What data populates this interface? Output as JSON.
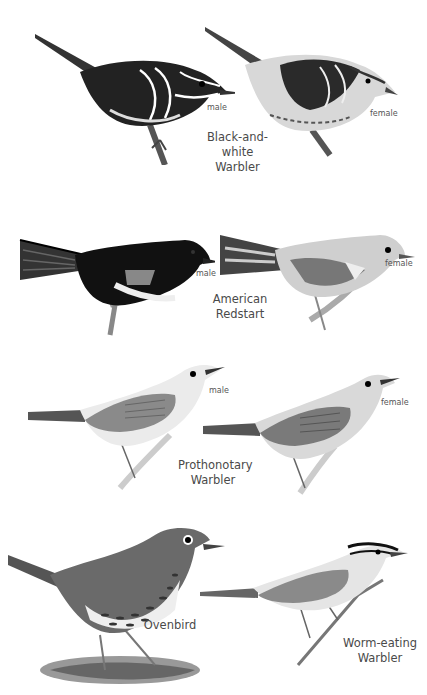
{
  "plate": {
    "groups": [
      {
        "species": [
          "Black-and-white",
          "Warbler"
        ],
        "figures": [
          {
            "sex": "male"
          },
          {
            "sex": "female"
          }
        ]
      },
      {
        "species": [
          "American",
          "Redstart"
        ],
        "figures": [
          {
            "sex": "male"
          },
          {
            "sex": "female"
          }
        ]
      },
      {
        "species": [
          "Prothonotary",
          "Warbler"
        ],
        "figures": [
          {
            "sex": "male"
          },
          {
            "sex": "female"
          }
        ]
      },
      {
        "species": [
          "Ovenbird"
        ],
        "figures": []
      },
      {
        "species": [
          "Worm-eating",
          "Warbler"
        ],
        "figures": []
      }
    ]
  },
  "colors": {
    "background": "#ffffff",
    "ink": "#1a1a1a",
    "label": "#555555"
  }
}
